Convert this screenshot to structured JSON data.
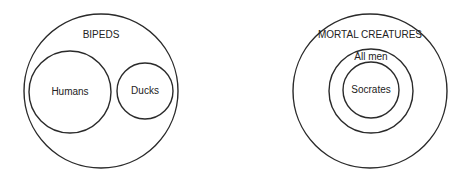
{
  "diagrams": [
    {
      "name": "bipeds-diagram",
      "outer": {
        "label": "BIPEDS",
        "cx": 101,
        "cy": 91,
        "r": 77,
        "label_y": 35
      },
      "inner": [
        {
          "label": "Humans",
          "cx": 70,
          "cy": 92,
          "r": 41,
          "label_y": 92
        },
        {
          "label": "Ducks",
          "cx": 145,
          "cy": 91,
          "r": 28,
          "label_y": 91
        }
      ]
    },
    {
      "name": "mortal-creatures-diagram",
      "outer": {
        "label": "MORTAL CREATURES",
        "cx": 370,
        "cy": 91,
        "r": 77,
        "label_y": 35
      },
      "inner": [
        {
          "label": "All men",
          "cx": 371,
          "cy": 91,
          "r": 42,
          "label_y": 57
        },
        {
          "label": "Socrates",
          "cx": 371,
          "cy": 90,
          "r": 28,
          "label_y": 90
        }
      ]
    }
  ],
  "colors": {
    "stroke": "#2a2a2a",
    "text": "#222222",
    "background": "#ffffff"
  }
}
